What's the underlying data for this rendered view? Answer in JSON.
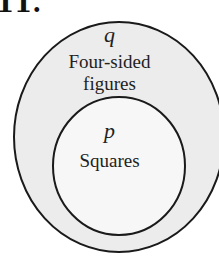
{
  "problem_number": "11.",
  "diagram": {
    "outer_set": {
      "variable": "q",
      "label_line1": "Four-sided",
      "label_line2": "figures",
      "fill": "#ececec"
    },
    "inner_set": {
      "variable": "p",
      "label": "Squares",
      "fill": "#f6f6f6"
    },
    "stroke": "#1a1a1a"
  }
}
